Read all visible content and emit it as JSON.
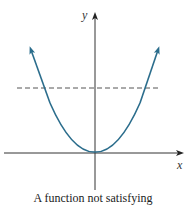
{
  "figure": {
    "caption": "A function not satisfying",
    "axes": {
      "x_label": "x",
      "y_label": "y"
    },
    "curve": {
      "type": "parabola",
      "shape": "upward opening, vertex at origin",
      "color": "#2b6d8c"
    },
    "horizontal_line": {
      "style": "dashed",
      "color": "#555555",
      "note": "horizontal line test intersects curve twice"
    },
    "colors": {
      "axes": "#333333",
      "curve": "#2b6d8c",
      "dashed_line": "#555555"
    }
  }
}
